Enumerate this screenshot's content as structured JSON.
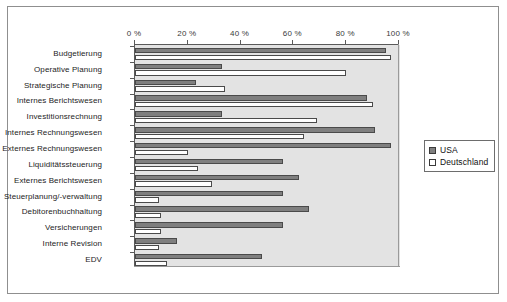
{
  "chart_data": {
    "type": "bar",
    "orientation": "horizontal",
    "title": "",
    "xlabel": "",
    "ylabel": "",
    "xlim": [
      0,
      100
    ],
    "grid": false,
    "legend_position": "right",
    "tick_suffix": " %",
    "xticks": [
      0,
      20,
      40,
      60,
      80,
      100
    ],
    "xtick_labels": [
      "0 %",
      "20 %",
      "40 %",
      "60 %",
      "80 %",
      "100 %"
    ],
    "categories": [
      "Budgetierung",
      "Operative Planung",
      "Strategische Planung",
      "Internes Berichtswesen",
      "Investitionsrechnung",
      "Internes Rechnungswesen",
      "Externes Rechnungswesen",
      "Liquiditätssteuerung",
      "Externes Berichtswesen",
      "Steuerplanung/-verwaltung",
      "Debitorenbuchhaltung",
      "Versicherungen",
      "Interne Revision",
      "EDV"
    ],
    "series": [
      {
        "name": "USA",
        "color": "#7f7f7f",
        "values": [
          95,
          33,
          23,
          88,
          33,
          91,
          97,
          56,
          62,
          56,
          66,
          56,
          16,
          48
        ]
      },
      {
        "name": "Deutschland",
        "color": "#ffffff",
        "values": [
          97,
          80,
          34,
          90,
          69,
          64,
          20,
          24,
          29,
          9,
          10,
          10,
          9,
          12
        ]
      }
    ]
  },
  "legend": {
    "items": [
      {
        "label": "USA",
        "swatch": "filled-gray-square-icon"
      },
      {
        "label": "Deutschland",
        "swatch": "empty-white-square-icon"
      }
    ]
  }
}
